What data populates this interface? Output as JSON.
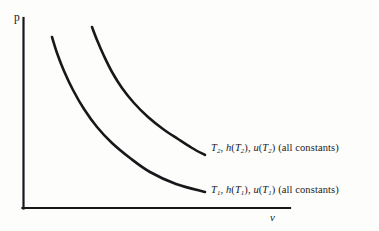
{
  "figure": {
    "background_color": "#fdfdfc",
    "line_color": "#18181b",
    "axes": {
      "y_label": "p",
      "x_label": "v",
      "origin_x": 23,
      "origin_y": 208,
      "y_top": 18,
      "x_right": 290
    },
    "labels": {
      "upper": {
        "symbol": "T",
        "subscript": "2",
        "h_text": "h",
        "u_text": "u",
        "constants_text": "(all constants)",
        "full_text": "T2, h(T2), u(T2) (all constants)"
      },
      "lower": {
        "symbol": "T",
        "subscript": "1",
        "h_text": "h",
        "u_text": "u",
        "constants_text": "(all constants)",
        "full_text": "T1, h(T1), u(T1) (all constants)"
      }
    }
  },
  "chart_data": {
    "type": "line",
    "title": "",
    "subtitle": "",
    "xlabel": "v",
    "ylabel": "p",
    "grid": false,
    "legend_position": "inline-right-of-curve",
    "xlim": [
      0,
      100
    ],
    "ylim": [
      0,
      100
    ],
    "axis_ticks": {
      "x": [],
      "y": []
    },
    "annotations": [
      {
        "text": "T2, h(T2), u(T2) (all constants)",
        "x_px": 211,
        "y_px": 148,
        "attached_to": "T2 isotherm"
      },
      {
        "text": "T1, h(T1), u(T1) (all constants)",
        "x_px": 211,
        "y_px": 190,
        "attached_to": "T1 isotherm"
      }
    ],
    "series": [
      {
        "name": "T2, h(T2), u(T2) (all constants)",
        "short_name": "T2",
        "description": "Upper isotherm, hyperbolic pv = constant curve",
        "color": "#18181b",
        "linewidth_px": 2.6,
        "points_px": [
          [
            92,
            27
          ],
          [
            97,
            40
          ],
          [
            104,
            56
          ],
          [
            112,
            72
          ],
          [
            122,
            88
          ],
          [
            134,
            103
          ],
          [
            148,
            117
          ],
          [
            163,
            129
          ],
          [
            178,
            139
          ],
          [
            192,
            148
          ],
          [
            205,
            155
          ]
        ]
      },
      {
        "name": "T1, h(T1), u(T1) (all constants)",
        "short_name": "T1",
        "description": "Lower isotherm, hyperbolic pv = constant curve",
        "color": "#18181b",
        "linewidth_px": 2.6,
        "points_px": [
          [
            52,
            37
          ],
          [
            57,
            53
          ],
          [
            64,
            71
          ],
          [
            73,
            90
          ],
          [
            84,
            109
          ],
          [
            97,
            127
          ],
          [
            112,
            143
          ],
          [
            130,
            158
          ],
          [
            150,
            172
          ],
          [
            176,
            184
          ],
          [
            205,
            192
          ]
        ]
      }
    ]
  }
}
